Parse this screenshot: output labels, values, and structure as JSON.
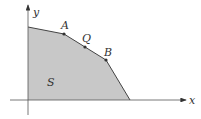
{
  "diagram": {
    "axes": {
      "x_label": "x",
      "y_label": "y"
    },
    "region": {
      "label": "S",
      "fill": "#c8c8c8",
      "edge": "#444444"
    },
    "points": [
      {
        "label": "A"
      },
      {
        "label": "Q"
      },
      {
        "label": "B"
      }
    ]
  }
}
